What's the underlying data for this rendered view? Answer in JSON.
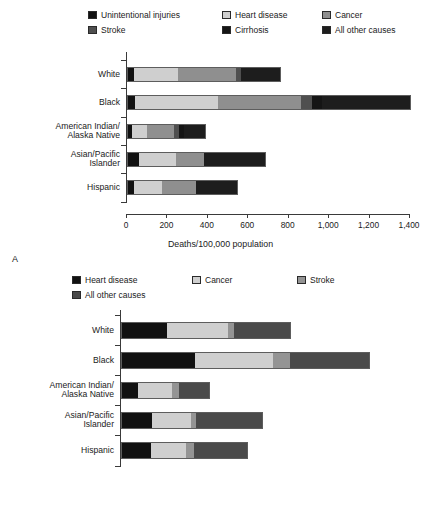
{
  "figure": {
    "panel_a_letter": "A",
    "panel_b_letter": "B"
  },
  "chart_data": [
    {
      "id": "panel_a",
      "type": "bar",
      "orientation": "horizontal",
      "stacked": true,
      "title": "",
      "xlabel": "Deaths/100,000 population",
      "ylabel": "",
      "xlim": [
        0,
        1400
      ],
      "xticks": [
        0,
        200,
        400,
        600,
        800,
        1000,
        1200,
        1400
      ],
      "xtick_labels": [
        "0",
        "200",
        "400",
        "600",
        "800",
        "1,000",
        "1,200",
        "1,400"
      ],
      "grid": false,
      "legend_position": "top",
      "categories": [
        "White",
        "Black",
        "American Indian/\nAlaska Native",
        "Asian/Pacific\nIslander",
        "Hispanic"
      ],
      "series": [
        {
          "name": "Unintentional injuries",
          "color": "#111111",
          "values": [
            35,
            42,
            25,
            58,
            35
          ]
        },
        {
          "name": "Heart disease",
          "color": "#cfcfcf",
          "values": [
            215,
            408,
            75,
            182,
            140
          ]
        },
        {
          "name": "Cancer",
          "color": "#8f8f8f",
          "values": [
            290,
            413,
            133,
            143,
            165
          ]
        },
        {
          "name": "Stroke",
          "color": "#4f4f4f",
          "values": [
            25,
            50,
            25,
            0,
            0
          ]
        },
        {
          "name": "Cirrhosis",
          "color": "#151515",
          "values": [
            0,
            50,
            25,
            0,
            0
          ]
        },
        {
          "name": "All other causes",
          "color": "#1d1d1d",
          "values": [
            195,
            442,
            107,
            307,
            210
          ]
        }
      ],
      "totals": [
        760,
        1405,
        390,
        690,
        550
      ]
    },
    {
      "id": "panel_b",
      "type": "bar",
      "orientation": "horizontal",
      "stacked": true,
      "title": "",
      "xlabel": "Deaths/100,000 population",
      "ylabel": "",
      "xlim": [
        0,
        4000
      ],
      "xticks": [
        0,
        500,
        1000,
        1500,
        2000,
        2500,
        3000,
        3500,
        4000
      ],
      "xtick_labels": [
        "0",
        "500",
        "1,000",
        "1,500",
        "2,000",
        "2,500",
        "3,000",
        "3,500",
        "4,000"
      ],
      "grid": false,
      "legend_position": "top",
      "categories": [
        "White",
        "Black",
        "American Indian/\nAlaska Native",
        "Asian/Pacific\nIslander",
        "Hispanic"
      ],
      "series": [
        {
          "name": "Heart disease",
          "color": "#111111",
          "values": [
            690,
            1110,
            255,
            460,
            450
          ]
        },
        {
          "name": "Cancer",
          "color": "#cfcfcf",
          "values": [
            910,
            1165,
            510,
            580,
            520
          ]
        },
        {
          "name": "Stroke",
          "color": "#949494",
          "values": [
            90,
            255,
            105,
            75,
            120
          ]
        },
        {
          "name": "All other causes",
          "color": "#4a4a4a",
          "values": [
            855,
            1180,
            465,
            1005,
            800
          ]
        }
      ],
      "totals": [
        2545,
        3710,
        1335,
        2120,
        1890
      ]
    }
  ],
  "panel_a": {
    "legend": [
      {
        "label": "Unintentional injuries",
        "color": "#111111"
      },
      {
        "label": "Heart disease",
        "color": "#cfcfcf"
      },
      {
        "label": "Cancer",
        "color": "#8f8f8f"
      },
      {
        "label": "Stroke",
        "color": "#4f4f4f"
      },
      {
        "label": "Cirrhosis",
        "color": "#151515"
      },
      {
        "label": "All other causes",
        "color": "#1d1d1d"
      }
    ],
    "categories": [
      "White",
      "Black",
      "American Indian/\nAlaska Native",
      "Asian/Pacific\nIslander",
      "Hispanic"
    ],
    "xtick_labels": [
      "0",
      "200",
      "400",
      "600",
      "800",
      "1,000",
      "1,200",
      "1,400"
    ],
    "axis_title": "Deaths/100,000 population"
  },
  "panel_b": {
    "legend": [
      {
        "label": "Heart disease",
        "color": "#111111"
      },
      {
        "label": "Cancer",
        "color": "#cfcfcf"
      },
      {
        "label": "Stroke",
        "color": "#949494"
      },
      {
        "label": "All other causes",
        "color": "#4a4a4a"
      }
    ],
    "categories": [
      "White",
      "Black",
      "American Indian/\nAlaska Native",
      "Asian/Pacific\nIslander",
      "Hispanic"
    ],
    "xtick_labels": [
      "0",
      "500",
      "1,000",
      "1,500",
      "2,000",
      "2,500",
      "3,000",
      "3,500",
      "4,000"
    ],
    "axis_title": "Deaths/100,000 population"
  }
}
